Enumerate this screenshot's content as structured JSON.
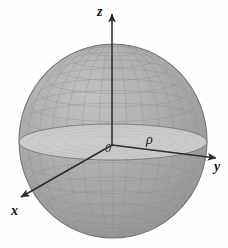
{
  "figure": {
    "background_color": "#fefefe",
    "sphere": {
      "center_x": 113,
      "center_y": 141,
      "radius_x": 94,
      "radius_y": 97,
      "fill_color": "#a9a9a9",
      "mesh_color": "#8a8a8a",
      "outline_color": "#7c7c7c",
      "mesh_parallels": 13,
      "mesh_meridians": 15
    },
    "equatorial_disk": {
      "center_x": 113,
      "center_y": 142,
      "radius_x": 94,
      "radius_y": 18,
      "fill_color": "#cccccc",
      "edge_color": "#777777"
    },
    "axes": {
      "color": "#2b2b2b",
      "origin": {
        "x": 112,
        "y": 145
      },
      "z": {
        "tip_x": 112,
        "tip_y": 12,
        "label": "z"
      },
      "y": {
        "tip_x": 219,
        "tip_y": 158,
        "label": "y"
      },
      "x": {
        "tip_x": 18,
        "tip_y": 199,
        "label": "x"
      }
    },
    "labels": {
      "z": "z",
      "y": "y",
      "x": "x",
      "origin": "0",
      "rho": "ρ"
    },
    "radius_segment": {
      "from_x": 112,
      "from_y": 145,
      "to_x": 207,
      "to_y": 152,
      "label": "ρ"
    }
  }
}
